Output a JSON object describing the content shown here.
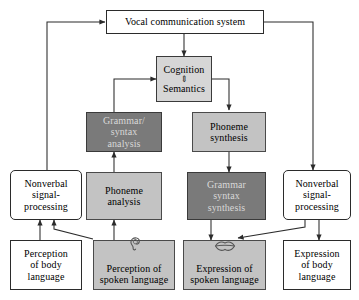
{
  "diagram": {
    "title_node": {
      "label": "Vocal communication system"
    },
    "cognition": {
      "top_label": "Cognition",
      "updown_arrow": "⇕",
      "bottom_label": "Semantics"
    },
    "nodes": {
      "grammar_syntax_analysis": "Grammar/\nsyntax\nanalysis",
      "phoneme_synthesis": "Phoneme\nsynthesis",
      "phoneme_analysis": "Phoneme\nanalysis",
      "grammar_syntax_synthesis": "Grammar\nsyntax\nsynthesis",
      "nonverbal_left": "Nonverbal\nsignal-\nprocessing",
      "nonverbal_right": "Nonverbal\nsignal-\nprocessing",
      "perception_body": "Perception\nof body\nlanguage",
      "perception_spoken": "Perception of\nspoken language",
      "expression_spoken": "Expression of\nspoken language",
      "expression_body": "Expression\nof body\nlanguage"
    },
    "icons": {
      "ear": "ear-icon",
      "lips": "lips-icon"
    },
    "colors": {
      "light_gray_fill": "#c3c3c3",
      "dark_gray_fill": "#7a7a7a",
      "cognition_fill": "#d6d6d6",
      "white_fill": "#ffffff",
      "line": "#2b2b2b",
      "dark_text_on_dark": "#d8d8d8"
    }
  }
}
